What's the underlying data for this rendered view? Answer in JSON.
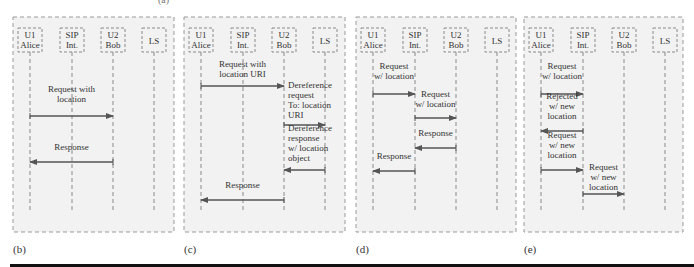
{
  "figure": {
    "top_label": "(a)",
    "participants": [
      {
        "id": "U1",
        "lines": [
          "U1",
          "Alice"
        ]
      },
      {
        "id": "SIP",
        "lines": [
          "SIP",
          "Int."
        ]
      },
      {
        "id": "U2",
        "lines": [
          "U2",
          "Bob"
        ]
      },
      {
        "id": "LS",
        "lines": [
          "LS"
        ]
      }
    ],
    "panels": [
      {
        "label": "(b)",
        "messages": [
          {
            "from": "U1",
            "to": "U2",
            "text": [
              "Request with",
              "location"
            ]
          },
          {
            "from": "U2",
            "to": "U1",
            "text": [
              "Response"
            ]
          }
        ]
      },
      {
        "label": "(c)",
        "messages": [
          {
            "from": "U1",
            "to": "U2",
            "text": [
              "Request with",
              "location URI"
            ]
          },
          {
            "from": "U2",
            "to": "LS",
            "text": [
              "Dereference",
              "request",
              "To: location",
              "URI"
            ]
          },
          {
            "from": "LS",
            "to": "U2",
            "text": [
              "Dereference",
              "response",
              "w/ location",
              "object"
            ]
          },
          {
            "from": "U2",
            "to": "U1",
            "text": [
              "Response"
            ]
          }
        ]
      },
      {
        "label": "(d)",
        "messages": [
          {
            "from": "U1",
            "to": "SIP",
            "text": [
              "Request",
              "w/ location"
            ]
          },
          {
            "from": "SIP",
            "to": "U2",
            "text": [
              "Request",
              "w/ location"
            ]
          },
          {
            "from": "U2",
            "to": "SIP",
            "text": [
              "Response"
            ]
          },
          {
            "from": "SIP",
            "to": "U1",
            "text": [
              "Response"
            ]
          }
        ]
      },
      {
        "label": "(e)",
        "messages": [
          {
            "from": "U1",
            "to": "SIP",
            "text": [
              "Request",
              "w/ location"
            ]
          },
          {
            "from": "SIP",
            "to": "U1",
            "text": [
              "Rejected",
              "w/ new",
              "location"
            ]
          },
          {
            "from": "U1",
            "to": "SIP",
            "text": [
              "Request",
              "w/ new",
              "location"
            ]
          },
          {
            "from": "SIP",
            "to": "U2",
            "text": [
              "Request",
              "w/ new",
              "location"
            ]
          }
        ]
      }
    ]
  }
}
